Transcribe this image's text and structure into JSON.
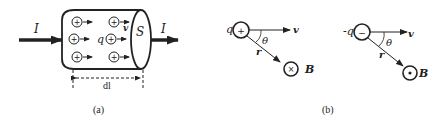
{
  "figure": {
    "panel_a": {
      "caption": "(a)",
      "current_label_in": "I",
      "current_label_out": "I",
      "cross_section_label": "S",
      "charge_label": "q",
      "velocity_label": "v",
      "length_label": "dl",
      "charge_sign": "+",
      "charge_count": 6
    },
    "panel_b": {
      "caption": "(b)",
      "left": {
        "charge_label": "q",
        "charge_sign": "+",
        "velocity_label": "v",
        "angle_label": "θ",
        "radius_label": "r",
        "field_label": "B",
        "field_symbol": "×"
      },
      "right": {
        "charge_label": "-q",
        "charge_sign": "−",
        "velocity_label": "v",
        "angle_label": "θ",
        "radius_label": "r",
        "field_label": "B",
        "field_symbol": "•"
      }
    }
  }
}
